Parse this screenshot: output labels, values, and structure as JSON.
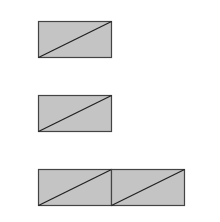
{
  "diagram": {
    "background": "#ffffff",
    "fill_color": "#c4c4c4",
    "stroke_color": "#444444",
    "shapes": [
      {
        "name": "rectangle-1",
        "x": 38,
        "y": 21,
        "w": 73,
        "h": 36,
        "diagonal": true
      },
      {
        "name": "rectangle-2",
        "x": 38,
        "y": 95,
        "w": 73,
        "h": 36,
        "diagonal": true
      },
      {
        "name": "rectangle-3a",
        "x": 38,
        "y": 169,
        "w": 73,
        "h": 36,
        "diagonal": true
      },
      {
        "name": "rectangle-3b",
        "x": 111,
        "y": 169,
        "w": 73,
        "h": 36,
        "diagonal": true
      }
    ]
  }
}
